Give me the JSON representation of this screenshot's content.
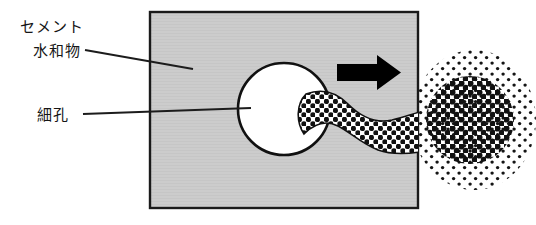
{
  "figure": {
    "type": "schematic-diagram",
    "title_present": false,
    "language": "ja"
  },
  "labels": {
    "cement_hydrate_line1": "セメント",
    "cement_hydrate_line2": "水和物",
    "pore": "細孔"
  },
  "colors": {
    "matrix_fill": "#cccccc",
    "matrix_stroke": "#1a1a1a",
    "pore_fill": "#ffffff",
    "pore_stroke": "#111111",
    "arrow_fill": "#000000",
    "dots": "#111111",
    "leader_line": "#1c1c1c",
    "background": "#ffffff",
    "text": "#161616"
  },
  "geometry": {
    "matrix_rect": {
      "x": 150,
      "y": 12,
      "width": 268,
      "height": 196
    },
    "pore_circle": {
      "cx": 284,
      "cy": 109,
      "r": 46
    },
    "arrow": {
      "x_start": 337,
      "x_end": 401,
      "y": 72,
      "direction": "right"
    },
    "plume_band": {
      "from_x": 310,
      "to_x": 418,
      "top_y": 92,
      "bottom_y": 152
    },
    "cloud_core": {
      "cx": 470,
      "cy": 120,
      "rx": 44,
      "ry": 44
    },
    "cloud_halo": {
      "cx": 474,
      "cy": 120,
      "rx": 62,
      "ry": 70
    }
  },
  "leader_lines": [
    {
      "name": "cement-hydrate-leader",
      "x1": 85,
      "y1": 50,
      "x2": 193,
      "y2": 69
    },
    {
      "name": "pore-leader",
      "x1": 83,
      "y1": 114,
      "x2": 251,
      "y2": 108
    }
  ],
  "dot_patterns": {
    "plume_spacing": 9,
    "plume_dot_radius": 2.6,
    "core_spacing": 9,
    "core_dot_radius": 3.1,
    "halo_spacing": 11,
    "halo_dot_radius": 1.7
  }
}
